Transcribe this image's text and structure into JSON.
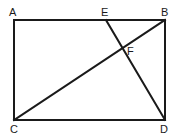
{
  "diagram": {
    "type": "geometry",
    "points": {
      "A": {
        "label": "A",
        "x": 14,
        "y": 20
      },
      "B": {
        "label": "B",
        "x": 165,
        "y": 20
      },
      "C": {
        "label": "C",
        "x": 14,
        "y": 120
      },
      "D": {
        "label": "D",
        "x": 165,
        "y": 120
      },
      "E": {
        "label": "E",
        "x": 106,
        "y": 20
      },
      "F": {
        "label": "F",
        "x": 123,
        "y": 48
      }
    },
    "segments": [
      {
        "from": "A",
        "to": "B"
      },
      {
        "from": "B",
        "to": "D"
      },
      {
        "from": "D",
        "to": "C"
      },
      {
        "from": "C",
        "to": "A"
      },
      {
        "from": "C",
        "to": "B"
      },
      {
        "from": "E",
        "to": "D"
      }
    ],
    "stroke_color": "#1a1a1a"
  }
}
